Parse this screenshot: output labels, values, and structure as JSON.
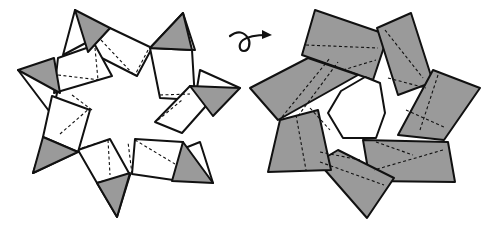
{
  "diagram": {
    "colors": {
      "paper_white": "#ffffff",
      "paper_colored": "#9a9a9a",
      "line": "#111111"
    },
    "figures": [
      {
        "id": "front",
        "description": "Seven-pointed star wreath, front side: white rectangular units with gray triangular tips, dashed valley fold lines"
      },
      {
        "id": "back",
        "description": "Seven-pointed star wreath, back side: overlapping gray rectangular units around a heptagonal hole, dashed fold lines"
      }
    ],
    "symbol": {
      "name": "turn-over",
      "meaning": "Turn the model over"
    }
  }
}
